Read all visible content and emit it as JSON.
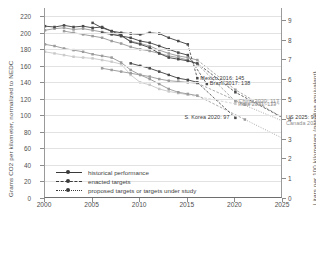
{
  "chart_data": {
    "type": "line",
    "title": "",
    "xlabel": "",
    "ylabel": "Grams CO2 per kilometer, normalized to NEDC",
    "ylabel_right": "Liters per 100 kilometers (gasoline equivalent)",
    "xlim": [
      2000,
      2025
    ],
    "ylim": [
      0,
      230
    ],
    "ylim_right": [
      0,
      9.6
    ],
    "grid": true,
    "legend_position": "lower-left-inside",
    "xticks": [
      "2000",
      "2005",
      "2010",
      "2015",
      "2020",
      "2025"
    ],
    "xtick_values": [
      2000,
      2005,
      2010,
      2015,
      2020,
      2025
    ],
    "yticks_left": [
      "0",
      "20",
      "40",
      "60",
      "80",
      "100",
      "120",
      "140",
      "160",
      "180",
      "200",
      "220"
    ],
    "ytick_values_left": [
      0,
      20,
      40,
      60,
      80,
      100,
      120,
      140,
      160,
      180,
      200,
      220
    ],
    "yticks_right": [
      "0",
      "1",
      "2",
      "3",
      "4",
      "5",
      "6",
      "7",
      "8",
      "9"
    ],
    "ytick_values_right": [
      0,
      1,
      2,
      3,
      4,
      5,
      6,
      7,
      8,
      9
    ],
    "legend": [
      {
        "label": "historical performance",
        "style": "solid"
      },
      {
        "label": "enacted targets",
        "style": "dash-dot"
      },
      {
        "label": "proposed targets or targets under study",
        "style": "dotted"
      }
    ],
    "annotations": [
      {
        "text": "Mexico 2016: 145",
        "x": 2016,
        "y": 145,
        "tone": "dark"
      },
      {
        "text": "Brazil 2017: 138",
        "x": 2017,
        "y": 138,
        "tone": "dark"
      },
      {
        "text": "Japan 2020: 114",
        "x": 2020,
        "y": 114,
        "tone": "light"
      },
      {
        "text": "China 2020: 117",
        "x": 2020,
        "y": 117,
        "tone": "mid"
      },
      {
        "text": "India 2021: 113",
        "x": 2021,
        "y": 113,
        "tone": "mid"
      },
      {
        "text": "S. Korea 2020: 97",
        "x": 2020,
        "y": 97,
        "tone": "dark"
      },
      {
        "text": "US 2025: 97",
        "x": 2025,
        "y": 97,
        "tone": "dark"
      },
      {
        "text": "Canada 2025: 97",
        "x": 2025,
        "y": 97,
        "tone": "mid"
      }
    ],
    "series": [
      {
        "name": "US",
        "tone": "dark",
        "historical": [
          [
            2000,
            208
          ],
          [
            2001,
            207
          ],
          [
            2002,
            209
          ],
          [
            2003,
            207
          ],
          [
            2004,
            208
          ],
          [
            2005,
            206
          ],
          [
            2006,
            207
          ],
          [
            2007,
            202
          ],
          [
            2008,
            197
          ],
          [
            2009,
            189
          ],
          [
            2010,
            186
          ],
          [
            2011,
            182
          ],
          [
            2012,
            175
          ],
          [
            2013,
            170
          ],
          [
            2014,
            168
          ],
          [
            2015,
            166
          ],
          [
            2016,
            163
          ]
        ],
        "enacted": [
          [
            2016,
            163
          ],
          [
            2020,
            128
          ],
          [
            2025,
            97
          ]
        ],
        "proposed": []
      },
      {
        "name": "Canada",
        "tone": "mid",
        "historical": [
          [
            2000,
            203
          ],
          [
            2001,
            205
          ],
          [
            2002,
            206
          ],
          [
            2003,
            204
          ],
          [
            2004,
            205
          ],
          [
            2005,
            203
          ],
          [
            2006,
            201
          ],
          [
            2007,
            199
          ],
          [
            2008,
            196
          ],
          [
            2009,
            190
          ],
          [
            2010,
            187
          ],
          [
            2011,
            184
          ],
          [
            2012,
            179
          ],
          [
            2013,
            175
          ],
          [
            2014,
            172
          ],
          [
            2015,
            170
          ],
          [
            2016,
            167
          ]
        ],
        "enacted": [
          [
            2016,
            167
          ],
          [
            2020,
            131
          ],
          [
            2025,
            97
          ]
        ],
        "proposed": []
      },
      {
        "name": "Mexico",
        "tone": "dark",
        "historical": [
          [
            2005,
            212
          ],
          [
            2006,
            206
          ],
          [
            2007,
            202
          ],
          [
            2008,
            200
          ],
          [
            2009,
            199
          ],
          [
            2010,
            198
          ],
          [
            2011,
            200
          ],
          [
            2012,
            199
          ],
          [
            2013,
            194
          ],
          [
            2014,
            190
          ],
          [
            2015,
            186
          ]
        ],
        "enacted": [
          [
            2015,
            186
          ],
          [
            2016,
            145
          ]
        ],
        "proposed": []
      },
      {
        "name": "Brazil",
        "tone": "dark",
        "historical": [
          [
            2006,
            200
          ],
          [
            2007,
            198
          ],
          [
            2008,
            196
          ],
          [
            2009,
            194
          ],
          [
            2010,
            190
          ],
          [
            2011,
            188
          ],
          [
            2012,
            184
          ],
          [
            2013,
            180
          ],
          [
            2014,
            176
          ],
          [
            2015,
            173
          ]
        ],
        "enacted": [
          [
            2015,
            173
          ],
          [
            2017,
            138
          ]
        ],
        "proposed": []
      },
      {
        "name": "EU",
        "tone": "mid",
        "historical": [
          [
            2000,
            186
          ],
          [
            2001,
            184
          ],
          [
            2002,
            181
          ],
          [
            2003,
            179
          ],
          [
            2004,
            177
          ],
          [
            2005,
            174
          ],
          [
            2006,
            172
          ],
          [
            2007,
            170
          ],
          [
            2008,
            164
          ],
          [
            2009,
            155
          ],
          [
            2010,
            149
          ],
          [
            2011,
            144
          ],
          [
            2012,
            138
          ],
          [
            2013,
            132
          ],
          [
            2014,
            128
          ],
          [
            2015,
            126
          ],
          [
            2016,
            124
          ]
        ],
        "enacted": [
          [
            2016,
            124
          ],
          [
            2021,
            95
          ]
        ],
        "proposed": [
          [
            2021,
            95
          ],
          [
            2025,
            72
          ]
        ]
      },
      {
        "name": "Japan",
        "tone": "light",
        "historical": [
          [
            2000,
            177
          ],
          [
            2001,
            175
          ],
          [
            2002,
            173
          ],
          [
            2003,
            171
          ],
          [
            2004,
            170
          ],
          [
            2005,
            169
          ],
          [
            2006,
            167
          ],
          [
            2007,
            165
          ],
          [
            2008,
            162
          ],
          [
            2009,
            149
          ],
          [
            2010,
            140
          ],
          [
            2011,
            137
          ],
          [
            2012,
            132
          ],
          [
            2013,
            129
          ],
          [
            2014,
            127
          ],
          [
            2015,
            125
          ]
        ],
        "enacted": [
          [
            2015,
            125
          ],
          [
            2020,
            114
          ]
        ],
        "proposed": []
      },
      {
        "name": "China",
        "tone": "mid",
        "historical": [
          [
            2002,
            202
          ],
          [
            2003,
            200
          ],
          [
            2004,
            198
          ],
          [
            2005,
            196
          ],
          [
            2006,
            194
          ],
          [
            2007,
            190
          ],
          [
            2008,
            187
          ],
          [
            2009,
            183
          ],
          [
            2010,
            180
          ],
          [
            2011,
            178
          ],
          [
            2012,
            175
          ],
          [
            2013,
            172
          ],
          [
            2014,
            170
          ],
          [
            2015,
            167
          ],
          [
            2016,
            162
          ]
        ],
        "enacted": [
          [
            2016,
            162
          ],
          [
            2020,
            117
          ]
        ],
        "proposed": [
          [
            2020,
            117
          ],
          [
            2025,
            93
          ]
        ]
      },
      {
        "name": "India",
        "tone": "mid",
        "historical": [
          [
            2006,
            157
          ],
          [
            2007,
            155
          ],
          [
            2008,
            153
          ],
          [
            2009,
            151
          ],
          [
            2010,
            149
          ],
          [
            2011,
            147
          ],
          [
            2012,
            144
          ],
          [
            2013,
            142
          ],
          [
            2014,
            141
          ],
          [
            2015,
            140
          ],
          [
            2016,
            139
          ]
        ],
        "enacted": [
          [
            2016,
            139
          ],
          [
            2021,
            113
          ]
        ],
        "proposed": []
      },
      {
        "name": "S. Korea",
        "tone": "dark",
        "historical": [
          [
            2009,
            163
          ],
          [
            2010,
            160
          ],
          [
            2011,
            157
          ],
          [
            2012,
            153
          ],
          [
            2013,
            149
          ],
          [
            2014,
            145
          ],
          [
            2015,
            143
          ],
          [
            2016,
            140
          ]
        ],
        "enacted": [
          [
            2016,
            140
          ],
          [
            2020,
            97
          ]
        ],
        "proposed": []
      }
    ]
  }
}
